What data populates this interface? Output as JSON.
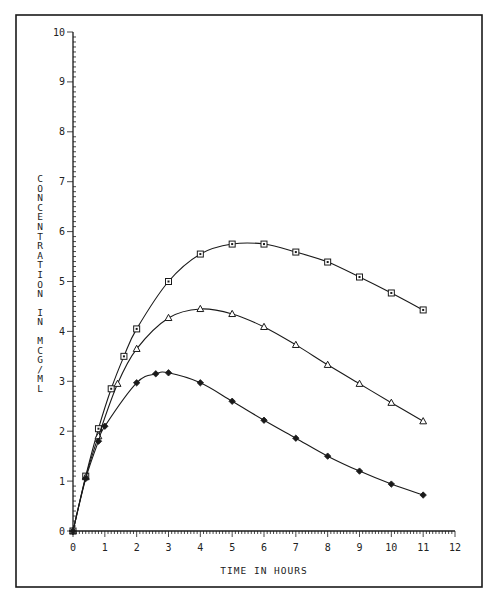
{
  "chart_data": {
    "type": "line",
    "title": "",
    "xlabel": "TIME IN HOURS",
    "ylabel": "CONCENTRATION IN MCG/ML",
    "xlim": [
      0,
      12
    ],
    "ylim": [
      0,
      10
    ],
    "x_ticks": [
      "0",
      "1",
      "2",
      "3",
      "4",
      "5",
      "6",
      "7",
      "8",
      "9",
      "10",
      "11",
      "12"
    ],
    "y_ticks": [
      "0",
      "1",
      "2",
      "3",
      "4",
      "5",
      "6",
      "7",
      "8",
      "9",
      "10"
    ],
    "grid": false,
    "legend": null,
    "series": [
      {
        "name": "square",
        "marker": "square",
        "points": [
          [
            0,
            0
          ],
          [
            0.4,
            1.1
          ],
          [
            0.8,
            2.05
          ],
          [
            1.2,
            2.85
          ],
          [
            1.6,
            3.5
          ],
          [
            2,
            4.05
          ],
          [
            3,
            5.0
          ],
          [
            4,
            5.55
          ],
          [
            5,
            5.75
          ],
          [
            6,
            5.75
          ],
          [
            7,
            5.59
          ],
          [
            8,
            5.39
          ],
          [
            9,
            5.09
          ],
          [
            10,
            4.77
          ],
          [
            11,
            4.43
          ]
        ]
      },
      {
        "name": "triangle",
        "marker": "triangle",
        "points": [
          [
            0,
            0
          ],
          [
            0.4,
            1.08
          ],
          [
            0.8,
            1.9
          ],
          [
            1.4,
            2.95
          ],
          [
            2,
            3.65
          ],
          [
            3,
            4.27
          ],
          [
            4,
            4.45
          ],
          [
            5,
            4.35
          ],
          [
            6,
            4.09
          ],
          [
            7,
            3.73
          ],
          [
            8,
            3.33
          ],
          [
            9,
            2.95
          ],
          [
            10,
            2.57
          ],
          [
            11,
            2.2
          ]
        ]
      },
      {
        "name": "diamond",
        "marker": "diamond",
        "points": [
          [
            0,
            0
          ],
          [
            0.4,
            1.05
          ],
          [
            0.8,
            1.8
          ],
          [
            1,
            2.1
          ],
          [
            2,
            2.97
          ],
          [
            2.6,
            3.15
          ],
          [
            3,
            3.17
          ],
          [
            4,
            2.97
          ],
          [
            5,
            2.6
          ],
          [
            6,
            2.22
          ],
          [
            7,
            1.86
          ],
          [
            8,
            1.5
          ],
          [
            9,
            1.2
          ],
          [
            10,
            0.94
          ],
          [
            11,
            0.72
          ]
        ]
      }
    ]
  },
  "colors": {
    "ink": "#1a1a1a",
    "background": "#ffffff"
  }
}
